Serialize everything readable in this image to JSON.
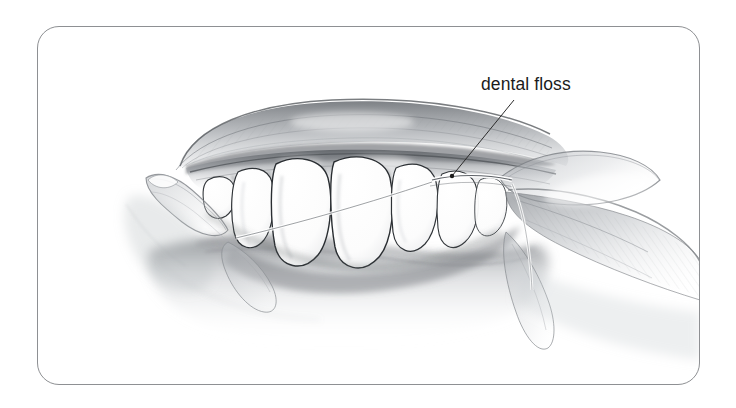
{
  "figure": {
    "kind": "pencil-illustration",
    "background_color": "#ffffff",
    "frame": {
      "border_color": "#8e9093",
      "corner_radius_px": 22,
      "x": 37,
      "y": 26,
      "width": 663,
      "height": 359
    }
  },
  "annotations": [
    {
      "id": "dental-floss",
      "label": "dental floss",
      "text_color": "#1b1b1b",
      "font_size_px": 17.5,
      "text_x": 481,
      "text_y": 74,
      "leader_line": {
        "color": "#2b2b2b",
        "width_px": 1,
        "from_x": 514,
        "from_y": 100,
        "to_x": 452,
        "to_y": 176,
        "dot_radius_px": 2.2
      }
    }
  ],
  "drawing": {
    "stroke_color": "#3a3a3a",
    "tooth_fill": "#ffffff",
    "tooth_outline": "#2f2f2f",
    "gum_shade_dark": "#6e7176",
    "gum_shade_mid": "#9ea2a7",
    "skin_shade": "#b9bcc0",
    "floss_color": "#4a4a4a",
    "parts": [
      {
        "name": "upper-lip",
        "description": "arched shaded upper lip across top of mouth"
      },
      {
        "name": "upper-gum",
        "description": "gum ridge beneath upper lip"
      },
      {
        "name": "teeth-row",
        "description": "row of seven upper teeth, two large central incisors"
      },
      {
        "name": "lower-lip",
        "description": "soft shaded lower lip fading downward"
      },
      {
        "name": "left-finger",
        "description": "finger entering from left holding floss"
      },
      {
        "name": "right-hand",
        "description": "hand and fingers at right holding floss taut"
      },
      {
        "name": "floss-strand",
        "description": "thin white floss strand between right teeth"
      }
    ]
  }
}
